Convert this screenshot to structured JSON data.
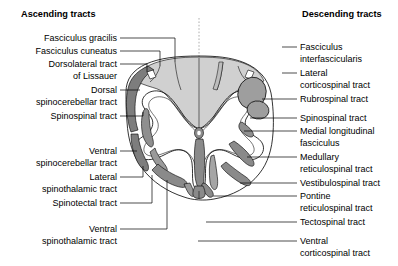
{
  "figure": {
    "headers": {
      "left": "Ascending tracts",
      "right": "Descending tracts"
    }
  },
  "colors": {
    "outline": "#000000",
    "background": "#ffffff",
    "dorsal_column_fill": "#d0d0d0",
    "tract_fill_dark": "#808080",
    "tract_fill_mid": "#969696",
    "tract_fill_light": "#b5b5b5",
    "grey_matter_fill": "#ffffff",
    "midline_dash": "#9a9a9a"
  },
  "ascending_labels": [
    {
      "id": "fasciculus-gracilis",
      "lines": [
        "Fasciculus gracilis"
      ],
      "text_x": 117,
      "text_y": 41,
      "leader": "M 120 38 L 175 38 L 175 62"
    },
    {
      "id": "fasciculus-cuneatus",
      "lines": [
        "Fasciculus cuneatus"
      ],
      "text_x": 117,
      "text_y": 54,
      "leader": "M 120 51 L 160 51 L 160 66"
    },
    {
      "id": "dorsolateral-tract-of-lissauer",
      "lines": [
        "Dorsolateral tract",
        "of Lissauer"
      ],
      "text_x": 117,
      "text_y": 67,
      "leader": "M 120 64 L 147 64 L 147 72"
    },
    {
      "id": "dorsal-spinocerebellar-tract",
      "lines": [
        "Dorsal",
        "spinocerebellar tract"
      ],
      "text_x": 117,
      "text_y": 93,
      "leader": "M 120 90 L 140 90"
    },
    {
      "id": "spinospinal-tract-left",
      "lines": [
        "Spinospinal tract"
      ],
      "text_x": 117,
      "text_y": 119,
      "leader": "M 120 116 L 143 116 L 143 112"
    },
    {
      "id": "ventral-spinocerebellar-tract",
      "lines": [
        "Ventral",
        "spinocerebellar tract"
      ],
      "text_x": 117,
      "text_y": 154,
      "leader": "M 120 151 L 137 151"
    },
    {
      "id": "lateral-spinothalamic-tract",
      "lines": [
        "Lateral",
        "spinothalamic tract"
      ],
      "text_x": 117,
      "text_y": 180,
      "leader": "M 120 177 L 143 177 L 143 166"
    },
    {
      "id": "spinotectal-tract",
      "lines": [
        "Spinotectal tract"
      ],
      "text_x": 117,
      "text_y": 206,
      "leader": "M 120 203 L 152 203 L 152 175"
    },
    {
      "id": "ventral-spinothalamic-tract",
      "lines": [
        "Ventral",
        "spinothalamic tract"
      ],
      "text_x": 117,
      "text_y": 232,
      "leader": "M 120 229 L 167 229 L 167 180"
    }
  ],
  "descending_labels": [
    {
      "id": "fasciculus-interfascicularis",
      "lines": [
        "Fasciculus",
        "interfascicularis"
      ],
      "text_x": 300,
      "text_y": 50,
      "leader": "M 282 47 L 297 47"
    },
    {
      "id": "lateral-corticospinal-tract",
      "lines": [
        "Lateral",
        "corticospinal tract"
      ],
      "text_x": 300,
      "text_y": 76,
      "leader": "M 282 73 L 297 73"
    },
    {
      "id": "rubrospinal-tract",
      "lines": [
        "Rubrospinal tract"
      ],
      "text_x": 300,
      "text_y": 102,
      "leader": "M 262 99 L 297 99"
    },
    {
      "id": "spinospinal-tract-right",
      "lines": [
        "Spinospinal tract"
      ],
      "text_x": 300,
      "text_y": 121,
      "leader": "M 250 118 L 297 118"
    },
    {
      "id": "medial-longitudinal-fasciculus",
      "lines": [
        "Medial longitudinal",
        "fasciculus"
      ],
      "text_x": 300,
      "text_y": 134,
      "leader": "M 244 131 L 297 131"
    },
    {
      "id": "medullary-reticulospinal-tract",
      "lines": [
        "Medullary",
        "reticulospinal tract"
      ],
      "text_x": 300,
      "text_y": 160,
      "leader": "M 247 157 L 297 157"
    },
    {
      "id": "vestibulospinal-tract",
      "lines": [
        "Vestibulospinal tract"
      ],
      "text_x": 300,
      "text_y": 186,
      "leader": "M 240 183 L 297 183"
    },
    {
      "id": "pontine-reticulospinal-tract",
      "lines": [
        "Pontine",
        "reticulospinal tract"
      ],
      "text_x": 300,
      "text_y": 199,
      "leader": "M 213 196 L 297 196"
    },
    {
      "id": "tectospinal-tract",
      "lines": [
        "Tectospinal tract"
      ],
      "text_x": 300,
      "text_y": 225,
      "leader": "M 206 222 L 297 222"
    },
    {
      "id": "ventral-corticospinal-tract",
      "lines": [
        "Ventral",
        "corticospinal tract"
      ],
      "text_x": 300,
      "text_y": 244,
      "leader": "M 198 241 L 297 241"
    }
  ],
  "cord_geometry": {
    "center_x": 199,
    "center_y": 128,
    "radius_x": 74,
    "radius_y": 72,
    "midline_x": 199,
    "midline_top": 18,
    "midline_bottom": 60
  }
}
